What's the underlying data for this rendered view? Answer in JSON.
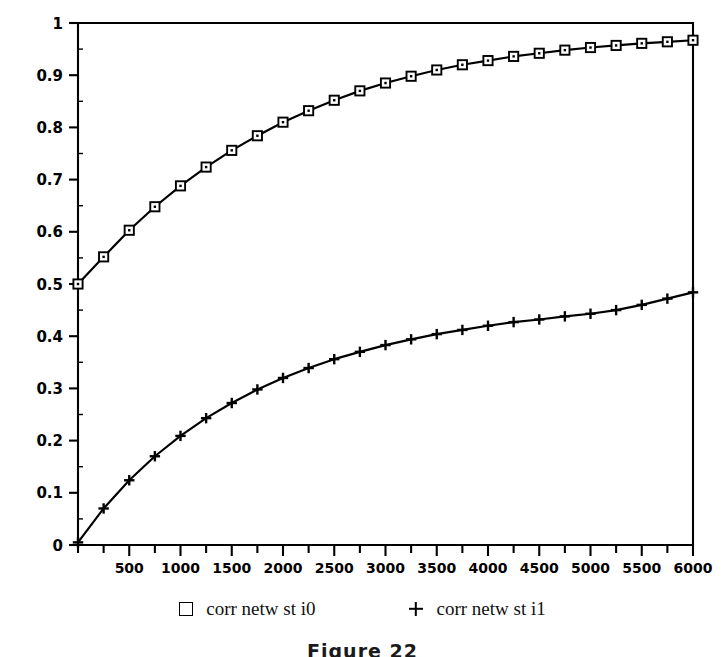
{
  "chart_data": {
    "type": "line",
    "title": "",
    "subtitle": "",
    "xlabel": "",
    "ylabel": "",
    "xlim": [
      0,
      6000
    ],
    "ylim": [
      0,
      1
    ],
    "grid": false,
    "legend_position": "bottom",
    "x_ticks": [
      0,
      250,
      500,
      750,
      1000,
      1250,
      1500,
      1750,
      2000,
      2250,
      2500,
      2750,
      3000,
      3250,
      3500,
      3750,
      4000,
      4250,
      4500,
      4750,
      5000,
      5250,
      5500,
      5750,
      6000
    ],
    "x_tick_labels": [
      "",
      "",
      "500",
      "",
      "1000",
      "",
      "1500",
      "",
      "2000",
      "",
      "2500",
      "",
      "3000",
      "",
      "3500",
      "",
      "4000",
      "",
      "4500",
      "",
      "5000",
      "",
      "5500",
      "",
      "6000"
    ],
    "y_ticks": [
      0,
      0.1,
      0.2,
      0.3,
      0.4,
      0.5,
      0.6,
      0.7,
      0.8,
      0.9,
      1
    ],
    "y_tick_labels": [
      "0",
      "0.1",
      "0.2",
      "0.3",
      "0.4",
      "0.5",
      "0.6",
      "0.7",
      "0.8",
      "0.9",
      "1"
    ],
    "x": [
      0,
      250,
      500,
      750,
      1000,
      1250,
      1500,
      1750,
      2000,
      2250,
      2500,
      2750,
      3000,
      3250,
      3500,
      3750,
      4000,
      4250,
      4500,
      4750,
      5000,
      5250,
      5500,
      5750,
      6000
    ],
    "series": [
      {
        "name": "corr netw st i0",
        "marker": "square",
        "color": "#000000",
        "values": [
          0.5,
          0.552,
          0.603,
          0.648,
          0.688,
          0.724,
          0.756,
          0.784,
          0.81,
          0.832,
          0.852,
          0.87,
          0.885,
          0.898,
          0.91,
          0.92,
          0.928,
          0.936,
          0.942,
          0.948,
          0.953,
          0.957,
          0.961,
          0.964,
          0.967
        ]
      },
      {
        "name": "corr netw st i1",
        "marker": "plus",
        "color": "#000000",
        "values": [
          0.005,
          0.07,
          0.124,
          0.17,
          0.209,
          0.243,
          0.272,
          0.298,
          0.32,
          0.339,
          0.356,
          0.37,
          0.383,
          0.394,
          0.404,
          0.412,
          0.42,
          0.427,
          0.432,
          0.438,
          0.443,
          0.45,
          0.46,
          0.472,
          0.484
        ]
      }
    ]
  },
  "legend": {
    "entries": [
      {
        "marker": "square-marker",
        "label": "corr netw st i0"
      },
      {
        "marker": "plus-marker",
        "label": "corr netw st i1"
      }
    ]
  },
  "caption": {
    "text": "Figure 22"
  }
}
